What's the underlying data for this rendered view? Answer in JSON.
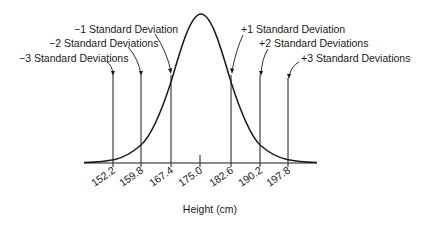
{
  "diagram": {
    "axis_title": "Height (cm)",
    "mean": 175.0,
    "std_dev": 7.6,
    "ticks": [
      "152.2",
      "159.8",
      "167.4",
      "175.0",
      "182.6",
      "190.2",
      "197.8"
    ],
    "labels": {
      "minus3": "−3 Standard Deviations",
      "minus2": "−2 Standard Deviations",
      "minus1": "−1 Standard Deviation",
      "plus1": "+1 Standard Deviation",
      "plus2": "+2 Standard Deviations",
      "plus3": "+3 Standard Deviations"
    },
    "colors": {
      "line": "#1a1a1a",
      "background": "#ffffff"
    }
  }
}
